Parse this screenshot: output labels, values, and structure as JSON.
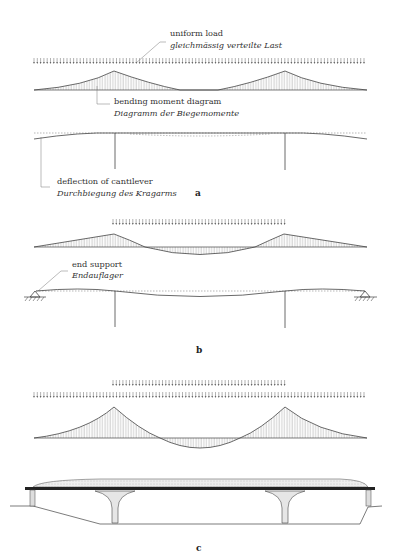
{
  "figure": {
    "panels": [
      {
        "id": "a",
        "label": "a",
        "annotations": {
          "uniform_load": {
            "en": "uniform load",
            "de": "gleichmässig verteilte Last"
          },
          "bending_moment": {
            "en": "bending moment diagram",
            "de": "Diagramm der Biegemomente"
          },
          "cantilever_deflection": {
            "en": "deflection of cantilever",
            "de": "Durchbiegung des Kragarms"
          }
        },
        "load": {
          "type": "uniform",
          "extent": "full span"
        }
      },
      {
        "id": "b",
        "label": "b",
        "annotations": {
          "end_support": {
            "en": "end support",
            "de": "Endauflager"
          }
        },
        "load": {
          "type": "uniform",
          "extent": "center span only"
        }
      },
      {
        "id": "c",
        "label": "c",
        "load": {
          "type": "uniform",
          "extent": "full span plus additional center span load"
        },
        "drawing": "bridge elevation with two piers and tapered deck"
      }
    ],
    "colors": {
      "ink": "#444444",
      "text": "#333333",
      "background": "#ffffff"
    }
  }
}
